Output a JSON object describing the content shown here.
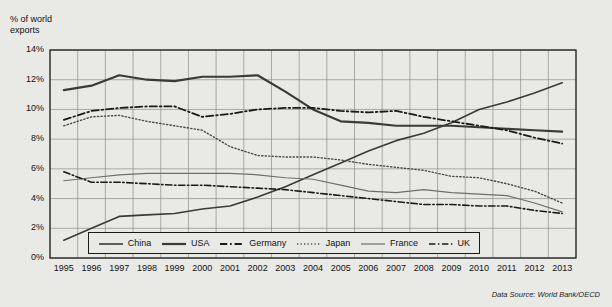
{
  "chart_data": {
    "type": "line",
    "ylabel": "% of world exports",
    "xlabel": "",
    "ylim": [
      0,
      14
    ],
    "ytick_labels": [
      "0%",
      "2%",
      "4%",
      "6%",
      "8%",
      "10%",
      "12%",
      "14%"
    ],
    "ytick_values": [
      0,
      2,
      4,
      6,
      8,
      10,
      12,
      14
    ],
    "grid": true,
    "legend_position": "bottom-inside",
    "source": "Data Source: World Bank/OECD",
    "x": [
      1995,
      1996,
      1997,
      1998,
      1999,
      2000,
      2001,
      2002,
      2003,
      2004,
      2005,
      2006,
      2007,
      2008,
      2009,
      2010,
      2011,
      2012,
      2013
    ],
    "categories": [
      "1995",
      "1996",
      "1997",
      "1998",
      "1999",
      "2000",
      "2001",
      "2002",
      "2003",
      "2004",
      "2005",
      "2006",
      "2007",
      "2008",
      "2009",
      "2010",
      "2011",
      "2012",
      "2013"
    ],
    "series": [
      {
        "name": "China",
        "style": "solid",
        "color": "#3a3a3a",
        "width": 1.6,
        "values": [
          1.2,
          2.0,
          2.8,
          2.9,
          3.0,
          3.3,
          3.5,
          4.1,
          4.8,
          5.6,
          6.4,
          7.2,
          7.9,
          8.4,
          9.1,
          10.0,
          10.5,
          11.1,
          11.8
        ]
      },
      {
        "name": "USA",
        "style": "solid",
        "color": "#3a3a3a",
        "width": 2.2,
        "values": [
          11.3,
          11.6,
          12.3,
          12.0,
          11.9,
          12.2,
          12.2,
          12.3,
          11.2,
          10.0,
          9.2,
          9.1,
          8.9,
          8.9,
          8.9,
          8.8,
          8.7,
          8.6,
          8.5
        ]
      },
      {
        "name": "Germany",
        "style": "dashdot",
        "color": "#1a1a1a",
        "width": 1.8,
        "values": [
          9.3,
          9.9,
          10.1,
          10.2,
          10.2,
          9.5,
          9.7,
          10.0,
          10.1,
          10.1,
          9.9,
          9.8,
          9.9,
          9.5,
          9.2,
          8.9,
          8.6,
          8.1,
          7.7
        ]
      },
      {
        "name": "Japan",
        "style": "dotted",
        "color": "#4a4a4a",
        "width": 1.4,
        "values": [
          8.9,
          9.5,
          9.6,
          9.2,
          8.9,
          8.6,
          7.5,
          6.9,
          6.8,
          6.8,
          6.6,
          6.3,
          6.1,
          5.9,
          5.5,
          5.4,
          5.0,
          4.5,
          3.7
        ]
      },
      {
        "name": "France",
        "style": "solid",
        "color": "#6e6e6e",
        "width": 1.2,
        "values": [
          5.2,
          5.4,
          5.6,
          5.7,
          5.7,
          5.7,
          5.7,
          5.6,
          5.4,
          5.3,
          4.9,
          4.5,
          4.4,
          4.6,
          4.4,
          4.3,
          4.2,
          3.7,
          3.1
        ]
      },
      {
        "name": "UK",
        "style": "dashdot",
        "color": "#1a1a1a",
        "width": 1.6,
        "values": [
          5.8,
          5.1,
          5.1,
          5.0,
          4.9,
          4.9,
          4.8,
          4.7,
          4.6,
          4.4,
          4.2,
          4.0,
          3.8,
          3.6,
          3.6,
          3.5,
          3.5,
          3.2,
          3.0
        ]
      }
    ]
  },
  "axis": {
    "y_title_line1": "% of world",
    "y_title_line2": "exports"
  },
  "legend": {
    "items": [
      {
        "label": "China"
      },
      {
        "label": "USA"
      },
      {
        "label": "Germany"
      },
      {
        "label": "Japan"
      },
      {
        "label": "France"
      },
      {
        "label": "UK"
      }
    ]
  },
  "footer": {
    "source": "Data Source: World Bank/OECD"
  }
}
